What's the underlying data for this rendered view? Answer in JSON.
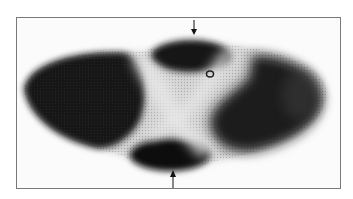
{
  "figure": {
    "type": "grayscale micrograph",
    "annotations": [
      {
        "kind": "arrow",
        "direction": "down",
        "position": "top-center"
      },
      {
        "kind": "arrow",
        "direction": "up",
        "position": "bottom-center"
      }
    ],
    "colors": {
      "background": "#ffffff",
      "frame": "#7a7a7a",
      "stain": "#141414",
      "tissue": "#d8d8d8"
    }
  }
}
